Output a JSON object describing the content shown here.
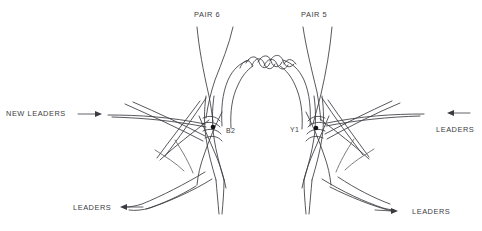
{
  "figure": {
    "background_color": "#ffffff",
    "line_color": "#3a3a40",
    "node_color": "#121214"
  },
  "labels": {
    "pair6": "PAIR 6",
    "pair5": "PAIR 5",
    "new_leaders": "NEW LEADERS",
    "leaders_right": "LEADERS",
    "leaders_bottom_left": "LEADERS",
    "leaders_bottom_right": "LEADERS",
    "node_b2": "B2",
    "node_y1": "Y1"
  },
  "nodes": [
    {
      "name": "B2",
      "x": 213,
      "y": 127
    },
    {
      "name": "Y1",
      "x": 316,
      "y": 128
    }
  ],
  "arrows": [
    {
      "name": "new-leaders-arrow",
      "direction": "right",
      "x": 100,
      "y": 114
    },
    {
      "name": "leaders-right-arrow",
      "direction": "left",
      "x": 450,
      "y": 113
    },
    {
      "name": "leaders-bottom-left-arrow",
      "direction": "left",
      "x": 123,
      "y": 207
    },
    {
      "name": "leaders-bottom-right-arrow",
      "direction": "right",
      "x": 395,
      "y": 211
    }
  ]
}
